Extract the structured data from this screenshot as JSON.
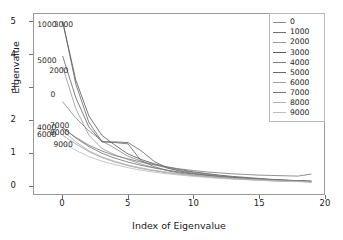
{
  "chart_data": {
    "type": "line",
    "title": "",
    "xlabel": "Index of Eigenvalue",
    "ylabel": "Eigenvalue",
    "xlim": [
      -2.2,
      20.0
    ],
    "ylim": [
      -0.28,
      5.25
    ],
    "xticks": [
      "0",
      "5",
      "10",
      "15",
      "20"
    ],
    "xtick_values": [
      0,
      5,
      10,
      15,
      20
    ],
    "yticks": [
      "0",
      "1",
      "2",
      "3",
      "4",
      "5"
    ],
    "ytick_values": [
      0,
      1,
      2,
      3,
      4,
      5
    ],
    "grid": false,
    "legend_position": "upper right",
    "x": [
      0,
      1,
      2,
      3,
      4,
      5,
      6,
      7,
      8,
      9,
      10,
      11,
      12,
      13,
      14,
      15,
      16,
      17,
      18,
      19
    ],
    "series": [
      {
        "name": "0",
        "color": "#8a8a8a",
        "values": [
          2.55,
          2.06,
          1.66,
          1.36,
          1.12,
          0.88,
          0.73,
          0.62,
          0.52,
          0.44,
          0.38,
          0.33,
          0.28,
          0.24,
          0.21,
          0.18,
          0.16,
          0.14,
          0.12,
          0.1
        ]
      },
      {
        "name": "1000",
        "color": "#6e6e6e",
        "values": [
          5.02,
          3.1,
          1.92,
          1.33,
          1.3,
          1.26,
          0.74,
          0.56,
          0.44,
          0.36,
          0.3,
          0.26,
          0.22,
          0.19,
          0.17,
          0.15,
          0.13,
          0.12,
          0.11,
          0.1
        ]
      },
      {
        "name": "2000",
        "color": "#9b9b9b",
        "values": [
          3.62,
          2.34,
          1.53,
          1.12,
          0.92,
          0.78,
          0.64,
          0.53,
          0.45,
          0.38,
          0.33,
          0.29,
          0.25,
          0.22,
          0.19,
          0.17,
          0.15,
          0.13,
          0.12,
          0.11
        ]
      },
      {
        "name": "3000",
        "color": "#5d5d5d",
        "values": [
          5.0,
          3.22,
          2.12,
          1.52,
          1.22,
          0.95,
          0.78,
          0.65,
          0.55,
          0.47,
          0.4,
          0.35,
          0.3,
          0.26,
          0.23,
          0.2,
          0.17,
          0.15,
          0.13,
          0.12
        ]
      },
      {
        "name": "4000",
        "color": "#7d7d7d",
        "values": [
          1.74,
          1.46,
          1.22,
          1.04,
          0.9,
          0.8,
          0.7,
          0.62,
          0.55,
          0.49,
          0.44,
          0.4,
          0.37,
          0.34,
          0.32,
          0.3,
          0.29,
          0.28,
          0.27,
          0.33
        ]
      },
      {
        "name": "5000",
        "color": "#696969",
        "values": [
          3.95,
          2.68,
          1.78,
          1.32,
          1.32,
          1.3,
          1.05,
          0.72,
          0.52,
          0.42,
          0.35,
          0.3,
          0.26,
          0.23,
          0.2,
          0.18,
          0.16,
          0.14,
          0.13,
          0.11
        ]
      },
      {
        "name": "6000",
        "color": "#a3a3a3",
        "values": [
          1.52,
          1.26,
          1.02,
          0.84,
          0.7,
          0.59,
          0.5,
          0.43,
          0.37,
          0.32,
          0.28,
          0.25,
          0.22,
          0.19,
          0.17,
          0.15,
          0.13,
          0.12,
          0.11,
          0.09
        ]
      },
      {
        "name": "7000",
        "color": "#767676",
        "values": [
          1.76,
          1.44,
          1.18,
          0.97,
          0.82,
          0.7,
          0.6,
          0.52,
          0.45,
          0.39,
          0.34,
          0.3,
          0.26,
          0.23,
          0.2,
          0.18,
          0.16,
          0.14,
          0.12,
          0.1
        ]
      },
      {
        "name": "8000",
        "color": "#b0b0b0",
        "values": [
          1.66,
          1.32,
          1.05,
          0.86,
          0.72,
          0.61,
          0.52,
          0.45,
          0.39,
          0.34,
          0.3,
          0.26,
          0.23,
          0.2,
          0.18,
          0.16,
          0.14,
          0.12,
          0.11,
          0.09
        ]
      },
      {
        "name": "9000",
        "color": "#bdbdbd",
        "values": [
          1.28,
          1.06,
          0.87,
          0.73,
          0.62,
          0.53,
          0.45,
          0.39,
          0.34,
          0.3,
          0.26,
          0.23,
          0.2,
          0.18,
          0.16,
          0.14,
          0.12,
          0.11,
          0.1,
          0.08
        ]
      }
    ],
    "annotations": [
      {
        "text": "1000",
        "x": -1.95,
        "y": 4.93
      },
      {
        "text": "3000",
        "x": -0.7,
        "y": 4.93
      },
      {
        "text": "5000",
        "x": -1.95,
        "y": 3.83
      },
      {
        "text": "2000",
        "x": -1.05,
        "y": 3.53
      },
      {
        "text": "0",
        "x": -0.95,
        "y": 2.8
      },
      {
        "text": "4000",
        "x": -1.98,
        "y": 1.8
      },
      {
        "text": "7000",
        "x": -0.98,
        "y": 1.84
      },
      {
        "text": "8000",
        "x": -0.98,
        "y": 1.64
      },
      {
        "text": "6000",
        "x": -1.98,
        "y": 1.58
      },
      {
        "text": "9000",
        "x": -0.72,
        "y": 1.26
      }
    ]
  }
}
